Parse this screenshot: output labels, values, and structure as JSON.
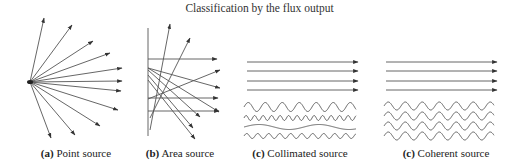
{
  "title": "Classification by the flux output",
  "colors": {
    "line": "#555555",
    "text": "#222222",
    "background": "#ffffff"
  },
  "panels": [
    {
      "id": "a",
      "tag": "(a)",
      "label": "Point source",
      "caption_x": 76
    },
    {
      "id": "b",
      "tag": "(b)",
      "label": "Area source",
      "caption_x": 180
    },
    {
      "id": "c1",
      "tag": "(c)",
      "label": "Collimated source",
      "caption_x": 300
    },
    {
      "id": "c2",
      "tag": "(c)",
      "label": "Coherent source",
      "caption_x": 446
    }
  ],
  "point_source": {
    "origin": [
      30,
      82
    ],
    "endpoints": [
      [
        44,
        18
      ],
      [
        72,
        25
      ],
      [
        93,
        41
      ],
      [
        110,
        53
      ],
      [
        122,
        68
      ],
      [
        122,
        81
      ],
      [
        121,
        91
      ],
      [
        118,
        110
      ],
      [
        100,
        126
      ],
      [
        75,
        135
      ],
      [
        51,
        138
      ]
    ]
  },
  "area_source": {
    "wall": {
      "x": 148,
      "y1": 28,
      "y2": 136
    },
    "rays": [
      [
        [
          148,
          59
        ],
        [
          217,
          59
        ]
      ],
      [
        [
          148,
          98
        ],
        [
          218,
          98
        ]
      ],
      [
        [
          148,
          111
        ],
        [
          219,
          111
        ]
      ],
      [
        [
          150,
          130
        ],
        [
          170,
          24
        ]
      ],
      [
        [
          150,
          118
        ],
        [
          190,
          38
        ]
      ],
      [
        [
          148,
          68
        ],
        [
          220,
          88
        ]
      ],
      [
        [
          148,
          99
        ],
        [
          220,
          70
        ]
      ],
      [
        [
          148,
          68
        ],
        [
          219,
          112
        ]
      ],
      [
        [
          148,
          70
        ],
        [
          200,
          117
        ]
      ],
      [
        [
          148,
          75
        ],
        [
          193,
          128
        ]
      ],
      [
        [
          148,
          80
        ],
        [
          195,
          139
        ]
      ]
    ]
  },
  "collimated": {
    "arrows": {
      "x1": 247,
      "x2": 358,
      "ys": [
        62,
        71,
        81,
        90
      ]
    },
    "waves": [
      {
        "y": 107,
        "amp": 4.5,
        "period": 17,
        "x1": 244,
        "x2": 356
      },
      {
        "y": 118,
        "amp": 2.5,
        "period": 8.5,
        "x1": 244,
        "x2": 356
      },
      {
        "y": 127,
        "amp": 2.5,
        "period": 60,
        "x1": 244,
        "x2": 356
      },
      {
        "y": 136,
        "amp": 2.5,
        "period": 11,
        "x1": 244,
        "x2": 356
      }
    ]
  },
  "coherent": {
    "arrows": {
      "x1": 386,
      "x2": 497,
      "ys": [
        62,
        71,
        81,
        90
      ]
    },
    "waves": [
      {
        "y": 106,
        "amp": 4,
        "period": 17,
        "x1": 384,
        "x2": 494
      },
      {
        "y": 116,
        "amp": 4,
        "period": 17,
        "x1": 384,
        "x2": 494
      },
      {
        "y": 126,
        "amp": 4,
        "period": 17,
        "x1": 384,
        "x2": 494
      },
      {
        "y": 136,
        "amp": 4,
        "period": 17,
        "x1": 384,
        "x2": 494
      }
    ]
  }
}
